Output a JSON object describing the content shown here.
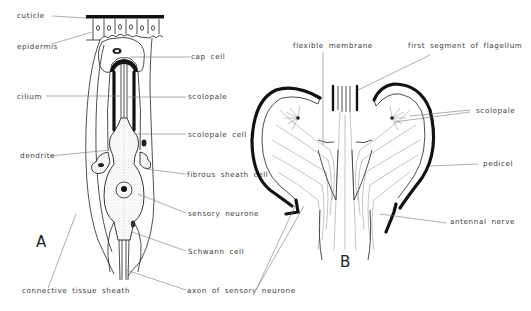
{
  "figure": {
    "panels": {
      "A": {
        "letter": "A"
      },
      "B": {
        "letter": "B"
      }
    }
  },
  "labels_a": {
    "cuticle": "cuticle",
    "epidermis": "epidermis",
    "cilium": "cilium",
    "dendrite": "dendrite",
    "connective_tissue_sheath": "connective tissue sheath",
    "cap_cell": "cap cell",
    "scolopale": "scolopale",
    "scolopale_cell": "scolopale cell",
    "fibrous_sheath_cell": "fibrous sheath cell",
    "sensory_neurone": "sensory neurone",
    "schwann_cell": "Schwann cell",
    "axon_of_sensory_neurone": "axon of sensory neurone"
  },
  "labels_b": {
    "flexible_membrane": "flexible membrane",
    "first_segment_of_flagellum": "first segment of flagellum",
    "scolopale": "scolopale",
    "pedicel": "pedicel",
    "antennal_nerve": "antennal nerve"
  },
  "colors": {
    "ink": "#111111",
    "label_text": "#3a3a3a",
    "leader_line": "#777777",
    "background": "#ffffff"
  }
}
